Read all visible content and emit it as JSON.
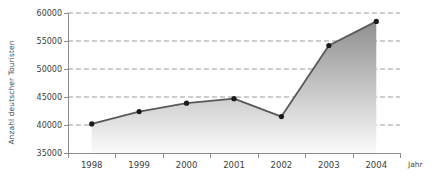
{
  "chart_data": {
    "type": "area",
    "title": "",
    "subtitle": "",
    "xlabel": "Jahr",
    "ylabel": "Anzahl deutscher Touristen",
    "categories": [
      "1998",
      "1999",
      "2000",
      "2001",
      "2002",
      "2003",
      "2004"
    ],
    "values": [
      40200,
      42400,
      43900,
      44700,
      41500,
      54200,
      58500
    ],
    "series": [
      {
        "name": "Anzahl deutscher Touristen",
        "values": [
          40200,
          42400,
          43900,
          44700,
          41500,
          54200,
          58500
        ]
      }
    ],
    "ylim": [
      35000,
      60000
    ],
    "ytick_labels": [
      "35000",
      "40000",
      "45000",
      "50000",
      "55000",
      "60000"
    ],
    "ytick_values": [
      35000,
      40000,
      45000,
      50000,
      55000,
      60000
    ],
    "grid": true,
    "grid_style": "dashed-horizontal",
    "legend": "none",
    "legend_position": "none",
    "markers": "filled-circle",
    "colors": {
      "line": "#595959",
      "marker": "#1a1a1a",
      "fill_top": "#8f8f8f",
      "fill_bottom": "#fbfbfb",
      "grid": "#9a9a9a",
      "axis": "#8c8c8c",
      "text": "#3d3d3d",
      "background": "#ffffff"
    }
  },
  "axes": {
    "y_title": "Anzahl deutscher Touristen",
    "x_title": "Jahr"
  }
}
